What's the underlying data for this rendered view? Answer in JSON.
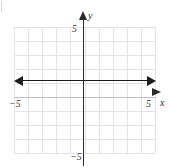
{
  "figure": {
    "name": "coordinate-plane-horizontal-line",
    "background_color": "#ffffff",
    "grid_color": "#e3e3e6",
    "axis_color": "#2a2a2a",
    "line_color": "#1b1b1b"
  },
  "axis_labels": {
    "x": "x",
    "y": "y"
  },
  "ticks": {
    "x_left": "−5",
    "x_right": "5",
    "y_top": "5",
    "y_bottom": "−5"
  },
  "chart_data": {
    "type": "line",
    "title": "",
    "subtitle": "",
    "xlabel": "x",
    "ylabel": "y",
    "xlim": [
      -5,
      5
    ],
    "ylim": [
      -5,
      5
    ],
    "xticks": [
      -5,
      5
    ],
    "yticks": [
      -5,
      5
    ],
    "xtick_labels": [
      "−5",
      "5"
    ],
    "ytick_labels": [
      "−5",
      "5"
    ],
    "grid": true,
    "grid_spacing": 1,
    "legend": "none",
    "axes_arrows": [
      "x-positive",
      "y-positive"
    ],
    "series": [
      {
        "name": "horizontal line y = 1",
        "equation": "y = 1",
        "style": "solid double-arrow segment",
        "x": [
          -5,
          5
        ],
        "values": [
          1,
          1
        ],
        "arrowheads": [
          "left",
          "right"
        ]
      }
    ],
    "annotations": []
  },
  "gridlines": {
    "vertical_count": 11,
    "horizontal_count": 10
  }
}
